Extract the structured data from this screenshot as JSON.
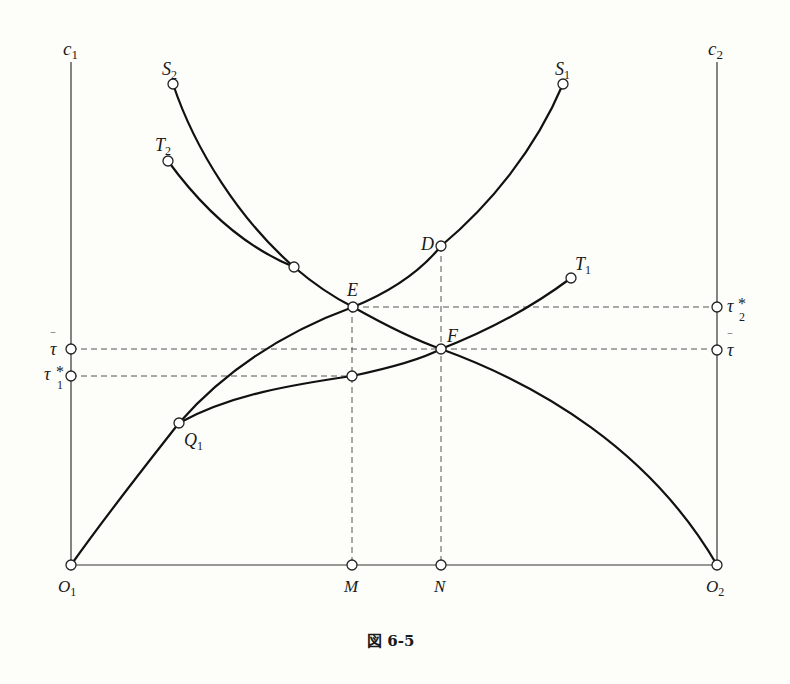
{
  "figure": {
    "caption": "図 6-5",
    "axes": {
      "left": {
        "label": "c",
        "sub": "1"
      },
      "right": {
        "label": "c",
        "sub": "2"
      }
    },
    "points": {
      "O1": {
        "label": "O",
        "sub": "1"
      },
      "O2": {
        "label": "O",
        "sub": "2"
      },
      "M": {
        "label": "M"
      },
      "N": {
        "label": "N"
      },
      "E": {
        "label": "E"
      },
      "F": {
        "label": "F"
      },
      "D": {
        "label": "D"
      },
      "Q1": {
        "label": "Q",
        "sub": "1"
      },
      "S1": {
        "label": "S",
        "sub": "1"
      },
      "S2": {
        "label": "S",
        "sub": "2"
      },
      "T1": {
        "label": "T",
        "sub": "1"
      },
      "T2": {
        "label": "T",
        "sub": "2"
      }
    },
    "left_ticks": {
      "tau_bar": {
        "label": "τ",
        "bar": "‾"
      },
      "tau1_star": {
        "label": "τ",
        "sup": "*",
        "sub": "1"
      }
    },
    "right_ticks": {
      "tau2_star": {
        "label": "τ",
        "sup": "*",
        "sub": "2"
      },
      "tau_bar": {
        "label": "τ",
        "bar": "‾"
      }
    },
    "colors": {
      "background": "#fdfdfa",
      "curve": "#111111",
      "dashed": "#555555"
    }
  }
}
